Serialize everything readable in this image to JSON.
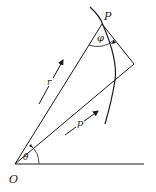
{
  "diagram": {
    "type": "geometry",
    "labels": {
      "origin": "O",
      "point": "P",
      "radius": "r",
      "perpendicular": "p",
      "polar_angle": "θ",
      "tangent_angle": "φ"
    },
    "colors": {
      "stroke": "#1a1a1a",
      "background": "#ffffff"
    }
  }
}
